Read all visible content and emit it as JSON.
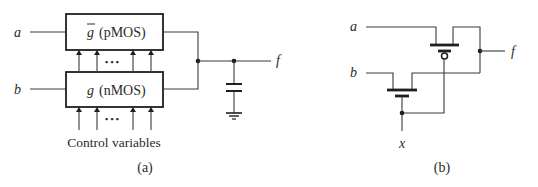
{
  "diagram_a": {
    "caption": "(a)",
    "input_a": "a",
    "input_b": "b",
    "output": "f",
    "pmos_block": {
      "symbol": "g",
      "symbol_overline": true,
      "label": "(pMOS)"
    },
    "nmos_block": {
      "symbol": "g",
      "label": "(nMOS)"
    },
    "ellipsis": "• • •",
    "control_label": "Control variables",
    "components": [
      "pmos-network",
      "nmos-network",
      "load-capacitor",
      "ground"
    ]
  },
  "diagram_b": {
    "caption": "(b)",
    "input_a": "a",
    "input_b": "b",
    "output": "f",
    "input_x": "x",
    "components": [
      "pmos-transistor",
      "nmos-transistor"
    ]
  },
  "colors": {
    "line": "#3a3a3a",
    "text": "#2a2a2a",
    "background": "#ffffff"
  }
}
